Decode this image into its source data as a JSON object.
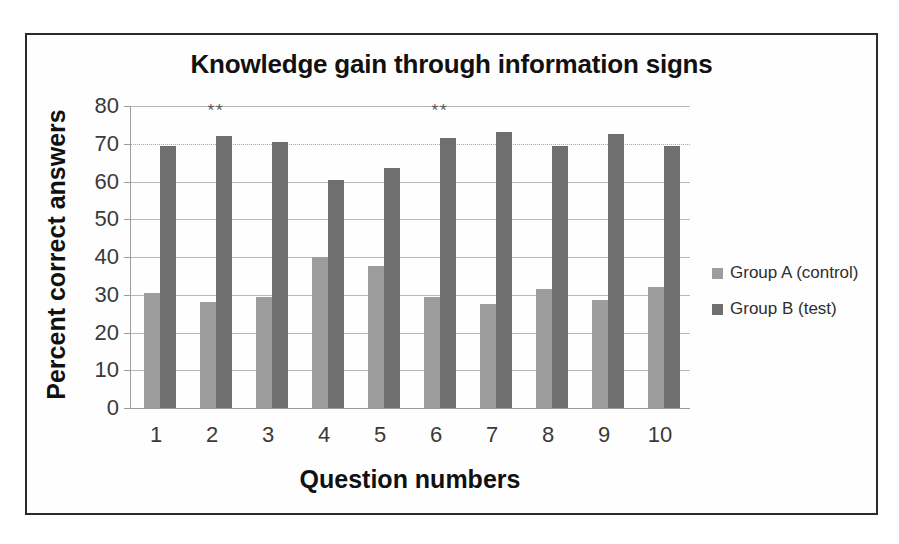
{
  "chart_data": {
    "type": "bar",
    "title": "Knowledge gain through information signs",
    "xlabel": "Question numbers",
    "ylabel": "Percent correct answers",
    "categories": [
      "1",
      "2",
      "3",
      "4",
      "5",
      "6",
      "7",
      "8",
      "9",
      "10"
    ],
    "ylim": [
      0,
      80
    ],
    "yticks": [
      0,
      10,
      20,
      30,
      40,
      50,
      60,
      70,
      80
    ],
    "grid": true,
    "legend_position": "right",
    "series": [
      {
        "name": "Group A (control)",
        "color": "#9d9d9d",
        "values": [
          30.5,
          28.0,
          29.5,
          40.0,
          37.5,
          29.5,
          27.5,
          31.5,
          28.5,
          32.0
        ]
      },
      {
        "name": "Group B (test)",
        "color": "#6f6f6f",
        "values": [
          69.5,
          72.0,
          70.5,
          60.5,
          63.5,
          71.5,
          73.0,
          69.5,
          72.5,
          69.5
        ]
      }
    ],
    "annotations": [
      {
        "category": "2",
        "text": "**"
      },
      {
        "category": "6",
        "text": "**"
      }
    ]
  },
  "legend": {
    "items": [
      {
        "label": "Group A (control)",
        "color": "#9d9d9d"
      },
      {
        "label": "Group B (test)",
        "color": "#6f6f6f"
      }
    ]
  }
}
